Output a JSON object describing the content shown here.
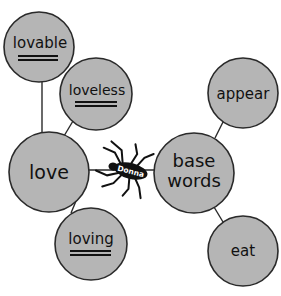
{
  "diagram": {
    "type": "word web",
    "colors": {
      "circle_fill": "#b5b5b5",
      "circle_stroke": "#2a2a2a",
      "text": "#111111",
      "spider": "#111111"
    },
    "center_nodes": {
      "love": {
        "label": "love"
      },
      "base_words": {
        "line1": "base",
        "line2": "words"
      }
    },
    "love_branches": [
      {
        "label": "lovable",
        "blank": "______"
      },
      {
        "label": "loveless",
        "blank": "______"
      },
      {
        "label": "loving",
        "blank": "______"
      }
    ],
    "base_word_branches": [
      {
        "label": "appear"
      },
      {
        "label": "eat"
      }
    ],
    "spider": {
      "name": "Donna"
    }
  }
}
